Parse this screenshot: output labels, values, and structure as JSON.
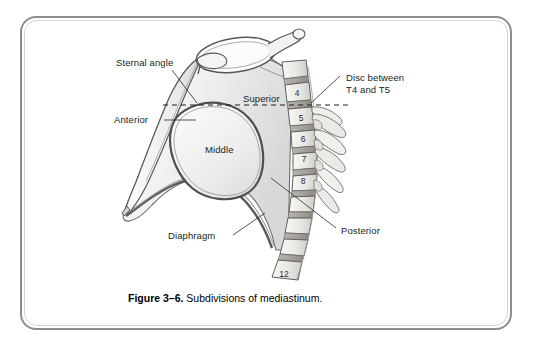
{
  "figure": {
    "caption_number": "Figure 3–6.",
    "caption_text": " Subdivisions of mediastinum.",
    "border_color": "#8e8e8e",
    "background_color": "#ffffff",
    "line_color": "#4a4a4a",
    "text_color": "#231f20"
  },
  "labels": {
    "sternal_angle": "Sternal angle",
    "anterior": "Anterior",
    "superior": "Superior",
    "middle": "Middle",
    "diaphragm": "Diaphragm",
    "posterior": "Posterior",
    "disc_between": "Disc between\nT4 and T5"
  },
  "vertebrae": [
    {
      "number": "4",
      "x": 290,
      "y": 88
    },
    {
      "number": "5",
      "x": 294,
      "y": 113
    },
    {
      "number": "6",
      "x": 296,
      "y": 134
    },
    {
      "number": "7",
      "x": 297,
      "y": 154
    },
    {
      "number": "8",
      "x": 296,
      "y": 176
    },
    {
      "number": "12",
      "x": 277,
      "y": 269
    }
  ],
  "anatomy": {
    "regions": [
      "Superior mediastinum",
      "Anterior mediastinum",
      "Middle mediastinum",
      "Posterior mediastinum"
    ],
    "landmark_line": "Sternal angle plane (transverse thoracic plane at disc between T4 and T5)",
    "spine_levels": "T4 through T12"
  }
}
